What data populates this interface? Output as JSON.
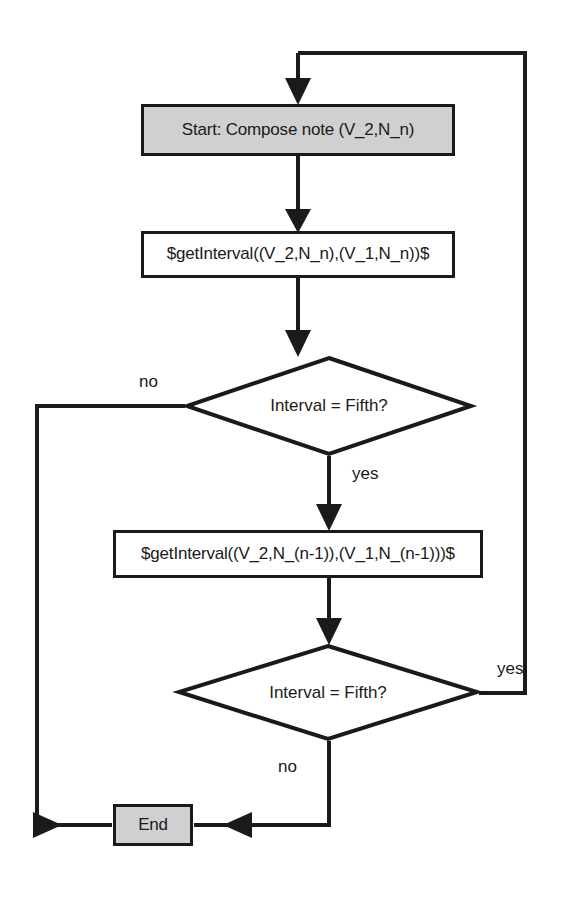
{
  "diagram": {
    "type": "flowchart",
    "colors": {
      "stroke": "#1a1a1a",
      "terminator_fill": "#d0d0d0",
      "process_fill": "#ffffff",
      "background": "#ffffff"
    },
    "nodes": {
      "start": {
        "label": "Start: Compose note (V_2,N_n)",
        "shape": "rectangle",
        "fill": "#d0d0d0"
      },
      "process_1": {
        "label": "$getInterval((V_2,N_n),(V_1,N_n))$",
        "shape": "rectangle",
        "fill": "#ffffff"
      },
      "decision_1": {
        "label": "Interval = Fifth?",
        "shape": "diamond",
        "fill": "#ffffff"
      },
      "process_2": {
        "label": "$getInterval((V_2,N_(n-1)),(V_1,N_(n-1)))$",
        "shape": "rectangle",
        "fill": "#ffffff"
      },
      "decision_2": {
        "label": "Interval = Fifth?",
        "shape": "diamond",
        "fill": "#ffffff"
      },
      "end": {
        "label": "End",
        "shape": "rectangle",
        "fill": "#d0d0d0"
      }
    },
    "edge_labels": {
      "decision_1_no": "no",
      "decision_1_yes": "yes",
      "decision_2_yes": "yes",
      "decision_2_no": "no"
    },
    "edges": [
      {
        "from": "start",
        "to": "process_1",
        "label": ""
      },
      {
        "from": "process_1",
        "to": "decision_1",
        "label": ""
      },
      {
        "from": "decision_1",
        "to": "end",
        "label": "no"
      },
      {
        "from": "decision_1",
        "to": "process_2",
        "label": "yes"
      },
      {
        "from": "process_2",
        "to": "decision_2",
        "label": ""
      },
      {
        "from": "decision_2",
        "to": "start",
        "label": "yes"
      },
      {
        "from": "decision_2",
        "to": "end",
        "label": "no"
      }
    ]
  }
}
